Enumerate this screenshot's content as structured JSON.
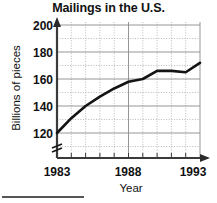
{
  "chart_data": {
    "type": "line",
    "title": "Mailings in the U.S.",
    "xlabel": "Year",
    "ylabel": "Billions of pieces",
    "xlim": [
      1983,
      1993
    ],
    "ylim": [
      110,
      200
    ],
    "y_axis_break": true,
    "grid": true,
    "grid_minor": true,
    "legend": "none",
    "x_ticks": [
      1983,
      1988,
      1993
    ],
    "x_tick_labels": [
      "1983",
      "1988",
      "1993"
    ],
    "y_ticks": [
      120,
      140,
      160,
      180,
      200
    ],
    "y_tick_labels": [
      "120",
      "140",
      "160",
      "180",
      "200"
    ],
    "x": [
      1983,
      1984,
      1985,
      1986,
      1987,
      1988,
      1989,
      1990,
      1991,
      1992,
      1993
    ],
    "values": [
      120,
      131,
      140,
      147,
      153,
      158,
      160,
      166,
      166,
      165,
      172
    ],
    "series": [
      {
        "name": "Mailings",
        "values": [
          120,
          131,
          140,
          147,
          153,
          158,
          160,
          166,
          166,
          165,
          172
        ]
      }
    ],
    "line_color": "#111111",
    "line_width": 2.6,
    "grid_color": "#8f8f8f",
    "axis_color": "#4a4a4a"
  },
  "figure": {
    "title": "Mailings in the U.S.",
    "y_axis_caption": "Billions of pieces",
    "x_axis_caption": "Year",
    "y_labels": [
      "200",
      "180",
      "160",
      "140",
      "120"
    ],
    "x_labels": [
      "1983",
      "1988",
      "1993"
    ]
  }
}
